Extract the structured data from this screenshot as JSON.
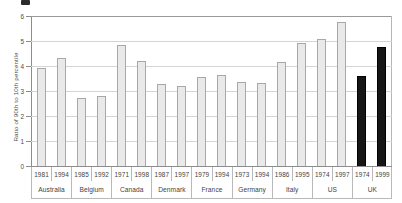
{
  "figure": {
    "marker_icon": "figure-number-marker"
  },
  "chart_data": {
    "type": "bar",
    "title": "",
    "xlabel": "",
    "ylabel": "Ratio of 90th to 10th percentile",
    "ylim": [
      0,
      6
    ],
    "yticks": [
      "0",
      "1",
      "2",
      "3",
      "4",
      "5",
      "6"
    ],
    "grid": true,
    "legend": "none",
    "colors": {
      "bar_light_fill": "#e9e9e9",
      "bar_light_border": "#a8a8a8",
      "bar_dark_fill": "#161616",
      "bar_dark_border": "#000000",
      "gridline": "#d4d4d4",
      "axis": "#8d8d8d"
    },
    "groups": [
      {
        "country": "Australia",
        "bars": [
          {
            "year": "1981",
            "value": 3.93,
            "style": "light"
          },
          {
            "year": "1994",
            "value": 4.33,
            "style": "light"
          }
        ]
      },
      {
        "country": "Belgium",
        "bars": [
          {
            "year": "1985",
            "value": 2.73,
            "style": "light"
          },
          {
            "year": "1992",
            "value": 2.8,
            "style": "light"
          }
        ]
      },
      {
        "country": "Canada",
        "bars": [
          {
            "year": "1971",
            "value": 4.85,
            "style": "light"
          },
          {
            "year": "1998",
            "value": 4.19,
            "style": "light"
          }
        ]
      },
      {
        "country": "Denmark",
        "bars": [
          {
            "year": "1987",
            "value": 3.28,
            "style": "light"
          },
          {
            "year": "1997",
            "value": 3.22,
            "style": "light"
          }
        ]
      },
      {
        "country": "France",
        "bars": [
          {
            "year": "1979",
            "value": 3.57,
            "style": "light"
          },
          {
            "year": "1994",
            "value": 3.64,
            "style": "light"
          }
        ]
      },
      {
        "country": "Germany",
        "bars": [
          {
            "year": "1973",
            "value": 3.35,
            "style": "light"
          },
          {
            "year": "1994",
            "value": 3.31,
            "style": "light"
          }
        ]
      },
      {
        "country": "Italy",
        "bars": [
          {
            "year": "1986",
            "value": 4.18,
            "style": "light"
          },
          {
            "year": "1995",
            "value": 4.93,
            "style": "light"
          }
        ]
      },
      {
        "country": "US",
        "bars": [
          {
            "year": "1974",
            "value": 5.08,
            "style": "light"
          },
          {
            "year": "1997",
            "value": 5.77,
            "style": "light"
          }
        ]
      },
      {
        "country": "UK",
        "bars": [
          {
            "year": "1974",
            "value": 3.59,
            "style": "dark"
          },
          {
            "year": "1999",
            "value": 4.78,
            "style": "dark"
          }
        ]
      }
    ]
  }
}
